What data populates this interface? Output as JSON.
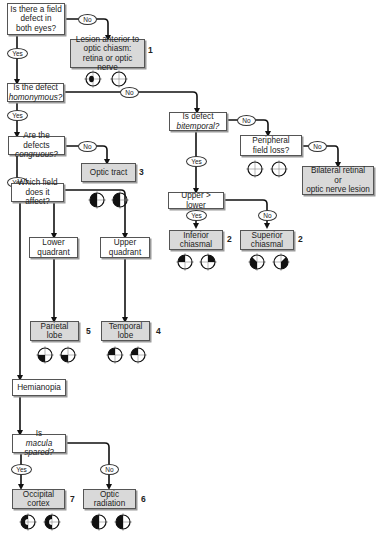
{
  "diagram": {
    "type": "flowchart",
    "topic": "Localization of visual field defects",
    "nodes": {
      "q_both_eyes": {
        "line1": "Is there a field",
        "line2": "defect in",
        "line3": "both eyes?"
      },
      "r_anterior": {
        "line1": "Lesion anterior to",
        "line2": "optic chiasm:",
        "line3": "retina or optic nerve",
        "ref": "1"
      },
      "q_homonymous": {
        "line1": "Is the defect",
        "line2": "homonymous?"
      },
      "q_bitemporal": {
        "line1": "Is defect",
        "line2": "bitemporal?"
      },
      "q_peripheral": {
        "line1": "Peripheral",
        "line2": "field loss?"
      },
      "r_bilateral": {
        "line1": "Bilateral retinal",
        "line2": "or",
        "line3": "optic nerve lesion"
      },
      "q_congruous": {
        "line1": "Are the defects",
        "line2": "congruous?"
      },
      "r_optic_tract": {
        "line1": "Optic tract",
        "ref": "3"
      },
      "n_upper_lower": {
        "line1": "Upper > lower"
      },
      "r_inferior_chiasmal": {
        "line1": "Inferior",
        "line2": "chiasmal",
        "ref": "2"
      },
      "r_superior_chiasmal": {
        "line1": "Superior",
        "line2": "chiasmal",
        "ref": "2"
      },
      "q_which_field": {
        "line1": "Which field",
        "line2": "does it affect?"
      },
      "n_lower_quadrant": {
        "line1": "Lower",
        "line2": "quadrant"
      },
      "n_upper_quadrant": {
        "line1": "Upper",
        "line2": "quadrant"
      },
      "r_parietal": {
        "line1": "Parietal",
        "line2": "lobe",
        "ref": "5"
      },
      "r_temporal": {
        "line1": "Temporal",
        "line2": "lobe",
        "ref": "4"
      },
      "n_hemianopia": {
        "line1": "Hemianopia"
      },
      "q_macula": {
        "line1": "Is ",
        "line1_italic": "macula",
        "line2": "spared?"
      },
      "r_occipital": {
        "line1": "Occipital",
        "line2": "cortex",
        "ref": "7"
      },
      "r_optic_radiation": {
        "line1": "Optic",
        "line2": "radiation",
        "ref": "6"
      }
    },
    "edge_labels": {
      "yes": "Yes",
      "no": "No"
    },
    "visual_fields": {
      "r_anterior": [
        "left: central scotoma",
        "right: normal"
      ],
      "q_peripheral": [
        "left: normal",
        "right: normal"
      ],
      "r_optic_tract": [
        "left: left hemifield loss (incongruous)",
        "right: left hemifield loss (incongruous)"
      ],
      "r_inferior_chiasmal": [
        "left: upper temporal quadrant",
        "right: upper temporal quadrant"
      ],
      "r_superior_chiasmal": [
        "left: lower temporal quadrant",
        "right: lower temporal quadrant"
      ],
      "r_parietal": [
        "left: lower left quadrant",
        "right: lower left quadrant"
      ],
      "r_temporal": [
        "left: upper left quadrant",
        "right: upper left quadrant"
      ],
      "r_occipital": [
        "left: left hemianopia, macula spared",
        "right: left hemianopia, macula spared"
      ],
      "r_optic_radiation": [
        "left: left hemianopia",
        "right: left hemianopia"
      ]
    }
  }
}
